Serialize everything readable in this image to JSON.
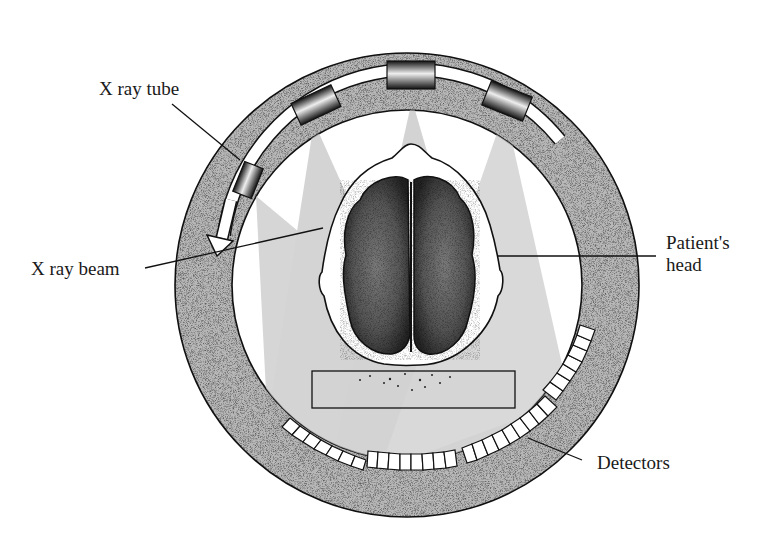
{
  "diagram": {
    "labels": {
      "xray_tube": "X ray tube",
      "xray_beam": "X ray beam",
      "patient_head_line1": "Patient's",
      "patient_head_line2": "head",
      "detectors": "Detectors"
    },
    "colors": {
      "ring_fill": "#b9b9b9",
      "beam_fill": "#c8c8c8",
      "outline": "#111111",
      "brain_dark": "#3a3a3a"
    }
  }
}
